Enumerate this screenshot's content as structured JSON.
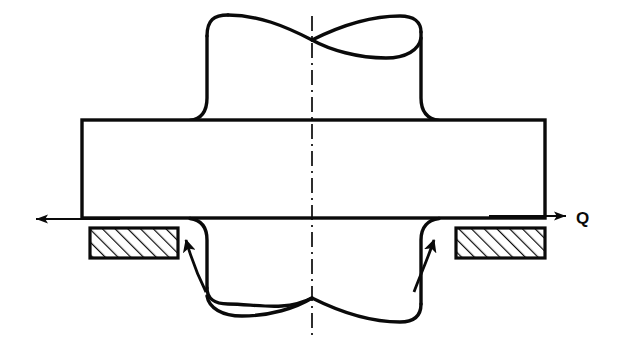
{
  "figure": {
    "type": "engineering-drawing",
    "background_color": "#ffffff",
    "line_color": "#0a0a0a",
    "labels": [
      {
        "id": "load-q",
        "text": "Q",
        "x": 580,
        "y": 224
      }
    ],
    "force_arrows": [
      {
        "id": "force-arrow-left",
        "direction": "left",
        "from_x": 118,
        "from_y": 219,
        "to_x": 33,
        "to_y": 219
      },
      {
        "id": "force-arrow-right",
        "direction": "right",
        "from_x": 488,
        "from_y": 216,
        "to_x": 568,
        "to_y": 216
      }
    ],
    "curved_arrows": [
      {
        "id": "stress-arrow-left",
        "direction": "up-left",
        "tip_x": 183,
        "tip_y": 230
      },
      {
        "id": "stress-arrow-right",
        "direction": "up-right",
        "tip_x": 437,
        "tip_y": 230
      }
    ],
    "gaskets": [
      {
        "id": "gasket-left",
        "x": 90,
        "y": 228,
        "width": 88,
        "height": 30,
        "hatch": "diagonal-45"
      },
      {
        "id": "gasket-right",
        "x": 456,
        "y": 228,
        "width": 89,
        "height": 30,
        "hatch": "diagonal-45"
      }
    ],
    "flange": {
      "id": "flange-plate",
      "x": 82,
      "y": 120,
      "width": 463,
      "height": 98
    },
    "pipe": {
      "id": "pipe-body",
      "left_wall_x": 207,
      "right_wall_x": 420,
      "top_y": 14,
      "bottom_y": 336,
      "ellipse_rx": 107,
      "ellipse_ry": 22
    },
    "centerline": {
      "id": "axis-centerline",
      "x": 312,
      "y_top": 16,
      "y_bottom": 340,
      "style": "dash-dot"
    }
  }
}
